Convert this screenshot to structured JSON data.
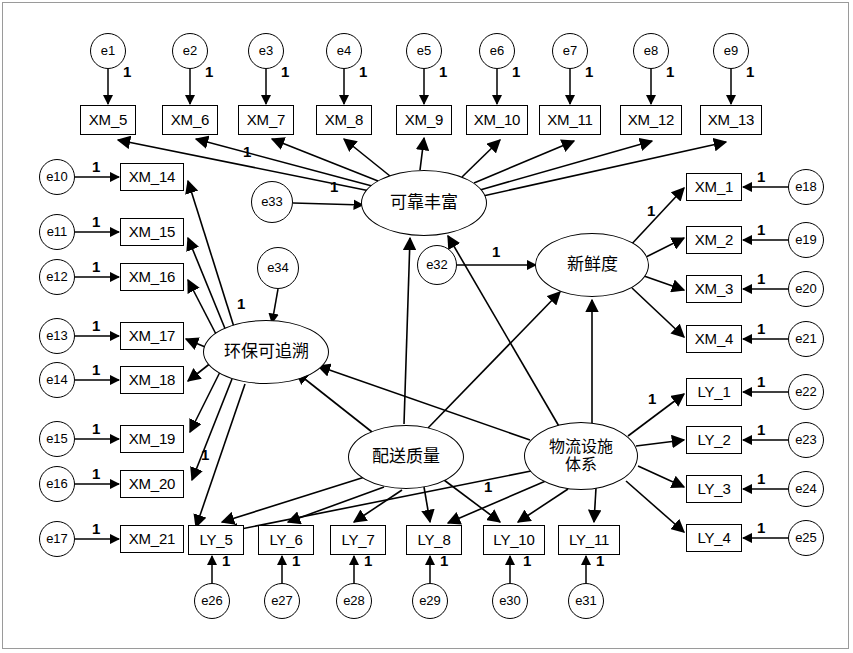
{
  "diagram": {
    "type": "sem-path-diagram",
    "colors": {
      "stroke": "#000000",
      "fill": "#ffffff",
      "frame": "#9a9a9a"
    },
    "latent_variables": [
      {
        "id": "F_reliable",
        "label": "可靠丰富",
        "cx": 424,
        "cy": 203,
        "rx": 63,
        "ry": 33,
        "lines": 1
      },
      {
        "id": "F_fresh",
        "label": "新鲜度",
        "cx": 592,
        "cy": 265,
        "rx": 57,
        "ry": 32,
        "lines": 1
      },
      {
        "id": "F_eco",
        "label": "环保可追溯",
        "cx": 266,
        "cy": 352,
        "rx": 63,
        "ry": 32,
        "lines": 1
      },
      {
        "id": "F_delivery",
        "label": "配送质量",
        "cx": 406,
        "cy": 457,
        "rx": 58,
        "ry": 32,
        "lines": 1
      },
      {
        "id": "F_logistics",
        "label": "物流设施\n体系",
        "label_l1": "物流设施",
        "label_l2": "体系",
        "cx": 581,
        "cy": 456,
        "rx": 57,
        "ry": 34,
        "lines": 2
      }
    ],
    "observed_top": [
      {
        "id": "XM_5",
        "label": "XM_5",
        "x": 80,
        "y": 105,
        "w": 56,
        "h": 30
      },
      {
        "id": "XM_6",
        "label": "XM_6",
        "x": 162,
        "y": 105,
        "w": 56,
        "h": 30
      },
      {
        "id": "XM_7",
        "label": "XM_7",
        "x": 238,
        "y": 105,
        "w": 56,
        "h": 30
      },
      {
        "id": "XM_8",
        "label": "XM_8",
        "x": 316,
        "y": 105,
        "w": 56,
        "h": 30
      },
      {
        "id": "XM_9",
        "label": "XM_9",
        "x": 396,
        "y": 105,
        "w": 56,
        "h": 30
      },
      {
        "id": "XM_10",
        "label": "XM_10",
        "x": 466,
        "y": 105,
        "w": 62,
        "h": 30
      },
      {
        "id": "XM_11",
        "label": "XM_11",
        "x": 539,
        "y": 105,
        "w": 62,
        "h": 30
      },
      {
        "id": "XM_12",
        "label": "XM_12",
        "x": 620,
        "y": 105,
        "w": 62,
        "h": 30
      },
      {
        "id": "XM_13",
        "label": "XM_13",
        "x": 700,
        "y": 105,
        "w": 62,
        "h": 30
      }
    ],
    "errors_top": [
      {
        "id": "e1",
        "label": "e1",
        "cx": 108,
        "cy": 51,
        "r": 18
      },
      {
        "id": "e2",
        "label": "e2",
        "cx": 190,
        "cy": 51,
        "r": 18
      },
      {
        "id": "e3",
        "label": "e3",
        "cx": 266,
        "cy": 51,
        "r": 18
      },
      {
        "id": "e4",
        "label": "e4",
        "cx": 344,
        "cy": 51,
        "r": 18
      },
      {
        "id": "e5",
        "label": "e5",
        "cx": 424,
        "cy": 51,
        "r": 18
      },
      {
        "id": "e6",
        "label": "e6",
        "cx": 497,
        "cy": 51,
        "r": 18
      },
      {
        "id": "e7",
        "label": "e7",
        "cx": 570,
        "cy": 51,
        "r": 18
      },
      {
        "id": "e8",
        "label": "e8",
        "cx": 651,
        "cy": 51,
        "r": 18
      },
      {
        "id": "e9",
        "label": "e9",
        "cx": 731,
        "cy": 51,
        "r": 18
      }
    ],
    "observed_left": [
      {
        "id": "XM_14",
        "label": "XM_14",
        "x": 120,
        "y": 163,
        "w": 64,
        "h": 28
      },
      {
        "id": "XM_15",
        "label": "XM_15",
        "x": 120,
        "y": 218,
        "w": 64,
        "h": 28
      },
      {
        "id": "XM_16",
        "label": "XM_16",
        "x": 120,
        "y": 263,
        "w": 64,
        "h": 28
      },
      {
        "id": "XM_17",
        "label": "XM_17",
        "x": 120,
        "y": 322,
        "w": 64,
        "h": 28
      },
      {
        "id": "XM_18",
        "label": "XM_18",
        "x": 120,
        "y": 366,
        "w": 64,
        "h": 28
      },
      {
        "id": "XM_19",
        "label": "XM_19",
        "x": 120,
        "y": 425,
        "w": 64,
        "h": 28
      },
      {
        "id": "XM_20",
        "label": "XM_20",
        "x": 120,
        "y": 470,
        "w": 64,
        "h": 28
      },
      {
        "id": "XM_21",
        "label": "XM_21",
        "x": 120,
        "y": 525,
        "w": 64,
        "h": 28
      }
    ],
    "errors_left": [
      {
        "id": "e10",
        "label": "e10",
        "cx": 57,
        "cy": 177,
        "r": 18
      },
      {
        "id": "e11",
        "label": "e11",
        "cx": 57,
        "cy": 232,
        "r": 18
      },
      {
        "id": "e12",
        "label": "e12",
        "cx": 57,
        "cy": 277,
        "r": 18
      },
      {
        "id": "e13",
        "label": "e13",
        "cx": 57,
        "cy": 336,
        "r": 18
      },
      {
        "id": "e14",
        "label": "e14",
        "cx": 57,
        "cy": 380,
        "r": 18
      },
      {
        "id": "e15",
        "label": "e15",
        "cx": 57,
        "cy": 439,
        "r": 18
      },
      {
        "id": "e16",
        "label": "e16",
        "cx": 57,
        "cy": 484,
        "r": 18
      },
      {
        "id": "e17",
        "label": "e17",
        "cx": 57,
        "cy": 539,
        "r": 18
      }
    ],
    "observed_right_xm": [
      {
        "id": "XM_1",
        "label": "XM_1",
        "x": 686,
        "y": 173,
        "w": 56,
        "h": 28
      },
      {
        "id": "XM_2",
        "label": "XM_2",
        "x": 686,
        "y": 226,
        "w": 56,
        "h": 28
      },
      {
        "id": "XM_3",
        "label": "XM_3",
        "x": 686,
        "y": 275,
        "w": 56,
        "h": 28
      },
      {
        "id": "XM_4",
        "label": "XM_4",
        "x": 686,
        "y": 325,
        "w": 56,
        "h": 28
      }
    ],
    "observed_right_ly": [
      {
        "id": "LY_1",
        "label": "LY_1",
        "x": 686,
        "y": 378,
        "w": 56,
        "h": 28
      },
      {
        "id": "LY_2",
        "label": "LY_2",
        "x": 686,
        "y": 426,
        "w": 56,
        "h": 28
      },
      {
        "id": "LY_3",
        "label": "LY_3",
        "x": 686,
        "y": 475,
        "w": 56,
        "h": 28
      },
      {
        "id": "LY_4",
        "label": "LY_4",
        "x": 686,
        "y": 524,
        "w": 56,
        "h": 28
      }
    ],
    "errors_right": [
      {
        "id": "e18",
        "label": "e18",
        "cx": 806,
        "cy": 187,
        "r": 18
      },
      {
        "id": "e19",
        "label": "e19",
        "cx": 806,
        "cy": 240,
        "r": 18
      },
      {
        "id": "e20",
        "label": "e20",
        "cx": 806,
        "cy": 289,
        "r": 18
      },
      {
        "id": "e21",
        "label": "e21",
        "cx": 806,
        "cy": 339,
        "r": 18
      },
      {
        "id": "e22",
        "label": "e22",
        "cx": 806,
        "cy": 392,
        "r": 18
      },
      {
        "id": "e23",
        "label": "e23",
        "cx": 806,
        "cy": 440,
        "r": 18
      },
      {
        "id": "e24",
        "label": "e24",
        "cx": 806,
        "cy": 489,
        "r": 18
      },
      {
        "id": "e25",
        "label": "e25",
        "cx": 806,
        "cy": 538,
        "r": 18
      }
    ],
    "observed_bottom": [
      {
        "id": "LY_5",
        "label": "LY_5",
        "x": 188,
        "y": 525,
        "w": 56,
        "h": 30
      },
      {
        "id": "LY_6",
        "label": "LY_6",
        "x": 258,
        "y": 525,
        "w": 56,
        "h": 30
      },
      {
        "id": "LY_7",
        "label": "LY_7",
        "x": 330,
        "y": 525,
        "w": 56,
        "h": 30
      },
      {
        "id": "LY_8",
        "label": "LY_8",
        "x": 406,
        "y": 525,
        "w": 56,
        "h": 30
      },
      {
        "id": "LY_10",
        "label": "LY_10",
        "x": 483,
        "y": 525,
        "w": 62,
        "h": 30
      },
      {
        "id": "LY_11",
        "label": "LY_11",
        "x": 558,
        "y": 525,
        "w": 62,
        "h": 30
      }
    ],
    "errors_bottom": [
      {
        "id": "e26",
        "label": "e26",
        "cx": 212,
        "cy": 601,
        "r": 18
      },
      {
        "id": "e27",
        "label": "e27",
        "cx": 282,
        "cy": 601,
        "r": 18
      },
      {
        "id": "e28",
        "label": "e28",
        "cx": 354,
        "cy": 601,
        "r": 18
      },
      {
        "id": "e29",
        "label": "e29",
        "cx": 430,
        "cy": 601,
        "r": 18
      },
      {
        "id": "e30",
        "label": "e30",
        "cx": 510,
        "cy": 601,
        "r": 18
      },
      {
        "id": "e31",
        "label": "e31",
        "cx": 586,
        "cy": 601,
        "r": 18
      }
    ],
    "errors_latent": [
      {
        "id": "e32",
        "label": "e32",
        "cx": 437,
        "cy": 265,
        "r": 20
      },
      {
        "id": "e33",
        "label": "e33",
        "cx": 272,
        "cy": 202,
        "r": 21
      },
      {
        "id": "e34",
        "label": "e34",
        "cx": 278,
        "cy": 268,
        "r": 21
      }
    ],
    "fixed_labels": [
      {
        "text": "1",
        "x": 123,
        "y": 63
      },
      {
        "text": "1",
        "x": 205,
        "y": 63
      },
      {
        "text": "1",
        "x": 281,
        "y": 63
      },
      {
        "text": "1",
        "x": 359,
        "y": 63
      },
      {
        "text": "1",
        "x": 439,
        "y": 63
      },
      {
        "text": "1",
        "x": 512,
        "y": 63
      },
      {
        "text": "1",
        "x": 585,
        "y": 63
      },
      {
        "text": "1",
        "x": 666,
        "y": 63
      },
      {
        "text": "1",
        "x": 746,
        "y": 63
      },
      {
        "text": "1",
        "x": 92,
        "y": 158
      },
      {
        "text": "1",
        "x": 92,
        "y": 213
      },
      {
        "text": "1",
        "x": 92,
        "y": 258
      },
      {
        "text": "1",
        "x": 92,
        "y": 317
      },
      {
        "text": "1",
        "x": 92,
        "y": 361
      },
      {
        "text": "1",
        "x": 92,
        "y": 420
      },
      {
        "text": "1",
        "x": 92,
        "y": 465
      },
      {
        "text": "1",
        "x": 92,
        "y": 520
      },
      {
        "text": "1",
        "x": 757,
        "y": 168
      },
      {
        "text": "1",
        "x": 757,
        "y": 221
      },
      {
        "text": "1",
        "x": 757,
        "y": 270
      },
      {
        "text": "1",
        "x": 757,
        "y": 320
      },
      {
        "text": "1",
        "x": 757,
        "y": 373
      },
      {
        "text": "1",
        "x": 757,
        "y": 421
      },
      {
        "text": "1",
        "x": 757,
        "y": 470
      },
      {
        "text": "1",
        "x": 757,
        "y": 519
      },
      {
        "text": "1",
        "x": 222,
        "y": 552
      },
      {
        "text": "1",
        "x": 292,
        "y": 552
      },
      {
        "text": "1",
        "x": 364,
        "y": 552
      },
      {
        "text": "1",
        "x": 440,
        "y": 552
      },
      {
        "text": "1",
        "x": 523,
        "y": 552
      },
      {
        "text": "1",
        "x": 596,
        "y": 552
      },
      {
        "text": "1",
        "x": 243,
        "y": 143
      },
      {
        "text": "1",
        "x": 330,
        "y": 178
      },
      {
        "text": "1",
        "x": 492,
        "y": 243
      },
      {
        "text": "1",
        "x": 647,
        "y": 202
      },
      {
        "text": "1",
        "x": 648,
        "y": 390
      },
      {
        "text": "1",
        "x": 237,
        "y": 295
      },
      {
        "text": "1",
        "x": 201,
        "y": 446
      },
      {
        "text": "1",
        "x": 484,
        "y": 478
      }
    ],
    "legend_note": {
      "factor_loading_fixed": "1",
      "observed_prefixes": [
        "XM",
        "LY"
      ],
      "error_prefix": "e",
      "error_count": 34
    }
  }
}
